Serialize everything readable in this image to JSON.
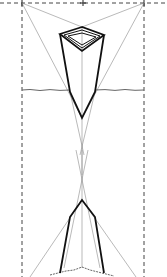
{
  "diagram": {
    "title": "",
    "type": "three-point perspective construction",
    "colors": {
      "background": "#ffffff",
      "construction": "#8a8a8a",
      "dashed": "#444444",
      "object": "#111111",
      "ground": "#666666"
    },
    "horizon_y": 3,
    "vanishing_points": [
      {
        "name": "left-vp",
        "x": 22,
        "y": 3
      },
      {
        "name": "right-vp",
        "x": 144,
        "y": 3
      },
      {
        "name": "center-mark",
        "x": 83,
        "y": 3
      }
    ],
    "objects": [
      {
        "name": "upper-tapered-prism",
        "view": "from above"
      },
      {
        "name": "lower-tapered-prism",
        "view": "from below"
      }
    ]
  }
}
